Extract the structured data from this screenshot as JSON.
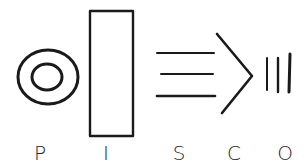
{
  "letters": [
    "P",
    "I",
    "S",
    "C",
    "O"
  ],
  "colors": {
    "ink": "#1a1a1a",
    "background": "#ffffff"
  }
}
